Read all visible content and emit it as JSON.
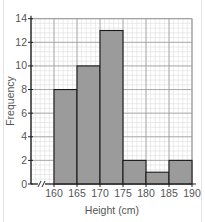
{
  "chart_data": {
    "type": "bar",
    "subtype": "histogram",
    "title": "",
    "xlabel": "Height (cm)",
    "ylabel": "Frequency",
    "bins": [
      {
        "from": 160,
        "to": 165,
        "frequency": 8
      },
      {
        "from": 165,
        "to": 170,
        "frequency": 10
      },
      {
        "from": 170,
        "to": 175,
        "frequency": 13
      },
      {
        "from": 175,
        "to": 180,
        "frequency": 2
      },
      {
        "from": 180,
        "to": 185,
        "frequency": 1
      },
      {
        "from": 185,
        "to": 190,
        "frequency": 2
      }
    ],
    "categories": [
      "160-165",
      "165-170",
      "170-175",
      "175-180",
      "180-185",
      "185-190"
    ],
    "values": [
      8,
      10,
      13,
      2,
      1,
      2
    ],
    "xticks": [
      "160",
      "165",
      "170",
      "175",
      "180",
      "185",
      "190"
    ],
    "yticks": [
      "0",
      "2",
      "4",
      "6",
      "8",
      "10",
      "12",
      "14"
    ],
    "xlim": [
      160,
      190
    ],
    "ylim": [
      0,
      14
    ],
    "x_axis_break": true,
    "grid": true,
    "legend": "none",
    "colors": {
      "bar_fill": "#9b9b9b",
      "bar_stroke": "#1a1a1a",
      "grid_minor": "#dddddd",
      "grid_major": "#9a9a9a",
      "axis": "#222222"
    }
  }
}
